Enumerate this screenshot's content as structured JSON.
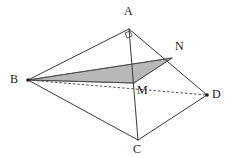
{
  "figure": {
    "background_color": "#ffffff",
    "stroke_color": "#3a3a3a",
    "shade_color": "#b4b4b4",
    "shade_stroke_color": "#6e6e6e",
    "label_color": "#1a1a1a",
    "canvas": {
      "width": 236,
      "height": 158
    }
  },
  "vertices": [
    {
      "id": "A",
      "label": "A",
      "x": 129,
      "y": 29,
      "label_x": 124,
      "label_y": 5,
      "dot": false
    },
    {
      "id": "B",
      "label": "B",
      "x": 28,
      "y": 80,
      "label_x": 10,
      "label_y": 73,
      "dot": true
    },
    {
      "id": "C",
      "label": "C",
      "x": 138,
      "y": 140,
      "label_x": 133,
      "label_y": 143,
      "dot": false
    },
    {
      "id": "D",
      "label": "D",
      "x": 207,
      "y": 95,
      "label_x": 212,
      "label_y": 88,
      "dot": true
    },
    {
      "id": "M",
      "label": "M",
      "x": 134,
      "y": 83,
      "label_x": 137,
      "label_y": 84,
      "dot": false
    },
    {
      "id": "N",
      "label": "N",
      "x": 172,
      "y": 58,
      "label_x": 175,
      "label_y": 40,
      "dot": false
    }
  ],
  "edges": [
    {
      "id": "AB",
      "from": "A",
      "to": "B",
      "style": "solid",
      "width": 1.0
    },
    {
      "id": "AD",
      "from": "A",
      "to": "D",
      "style": "solid",
      "width": 1.0
    },
    {
      "id": "AC",
      "from": "A",
      "to": "C",
      "style": "solid",
      "width": 1.0
    },
    {
      "id": "BC",
      "from": "B",
      "to": "C",
      "style": "solid",
      "width": 1.0
    },
    {
      "id": "CD",
      "from": "C",
      "to": "D",
      "style": "solid",
      "width": 1.0
    },
    {
      "id": "BD",
      "from": "B",
      "to": "D",
      "style": "dashed",
      "width": 0.9
    },
    {
      "id": "BN",
      "from": "B",
      "to": "N",
      "style": "solid",
      "width": 1.0
    },
    {
      "id": "NM",
      "from": "N",
      "to": "M",
      "style": "solid",
      "width": 1.0
    },
    {
      "id": "BM",
      "from": "B",
      "to": "M",
      "style": "solid",
      "width": 1.0
    }
  ],
  "shaded_region": {
    "id": "triangle-BNM",
    "vertex_ids": [
      "B",
      "N",
      "M"
    ],
    "points": "28,80 172,58 134,83",
    "fill": "#b4b4b4",
    "opacity": 0.95
  },
  "right_angle_mark": {
    "at_vertex": "A",
    "points": "125,33 130,31 132,36 127,38",
    "size": 6
  },
  "dash_pattern": "2.5,2"
}
